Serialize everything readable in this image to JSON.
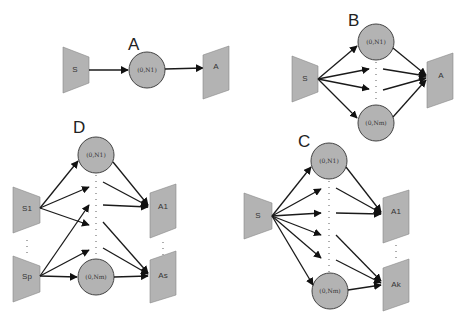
{
  "figure": {
    "background": "#ffffff",
    "node_fill": "#b3b3b3",
    "edge_color": "#1a1a1a"
  },
  "panels": {
    "A": {
      "label": "A",
      "source": "S",
      "hidden": "(0,N1)",
      "target": "A"
    },
    "B": {
      "label": "B",
      "source": "S",
      "hidden_top": "(0,N1)",
      "hidden_bottom": "(0,Nm)",
      "target": "A"
    },
    "C": {
      "label": "C",
      "source": "S",
      "hidden_top": "(0,N1)",
      "hidden_bottom": "(0,Nm)",
      "target_top": "A1",
      "target_bottom": "Ak"
    },
    "D": {
      "label": "D",
      "source_top": "S1",
      "source_bottom": "Sp",
      "hidden_top": "(0,N1)",
      "hidden_bottom": "(0,Nm)",
      "target_top": "A1",
      "target_bottom": "As"
    }
  }
}
